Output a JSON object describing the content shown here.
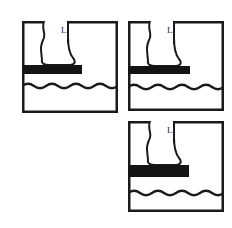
{
  "figure": {
    "type": "line-drawing-sequence",
    "background_color": "#ffffff",
    "ink_color": "#1a1a1a",
    "board_color": "#141414",
    "frame_color": "#1a1a1a",
    "panel_count": 3
  },
  "panels": [
    {
      "id": "panel-1",
      "index": 1,
      "position": "top-left",
      "x": 22,
      "y": 21,
      "width": 96,
      "height": 92,
      "frame_width": 2.5,
      "leg_label": "L",
      "label_x": 39,
      "label_y": 5,
      "board": {
        "name": "diving-board",
        "x": 0,
        "y": 44,
        "width": 60,
        "height": 9,
        "color": "#141414"
      },
      "water": {
        "name": "water-surface",
        "y": 65,
        "amplitude": 4.5,
        "cycles": 4,
        "stroke_width": 2.2
      },
      "foot": {
        "ankle_x": 30,
        "heel_x": 20,
        "toe_x": 52,
        "sole_y": 44,
        "leg_top_y": 0
      }
    },
    {
      "id": "panel-2",
      "index": 2,
      "position": "top-right",
      "x": 128,
      "y": 21,
      "width": 96,
      "height": 90,
      "frame_width": 2.5,
      "leg_label": "L",
      "label_x": 39,
      "label_y": 5,
      "board": {
        "name": "diving-board",
        "x": 0,
        "y": 45,
        "width": 62,
        "height": 8,
        "color": "#141414"
      },
      "water": {
        "name": "water-surface",
        "y": 66,
        "amplitude": 4.5,
        "cycles": 4,
        "stroke_width": 2.2
      },
      "foot": {
        "ankle_x": 30,
        "heel_x": 20,
        "toe_x": 52,
        "sole_y": 45,
        "leg_top_y": 0
      }
    },
    {
      "id": "panel-3",
      "index": 3,
      "position": "bottom-right",
      "x": 128,
      "y": 121,
      "width": 96,
      "height": 91,
      "frame_width": 2.5,
      "leg_label": "L",
      "label_x": 39,
      "label_y": 5,
      "board": {
        "name": "diving-board",
        "x": 0,
        "y": 44,
        "width": 61,
        "height": 12,
        "color": "#141414"
      },
      "water": {
        "name": "water-surface",
        "y": 72,
        "amplitude": 4.5,
        "cycles": 4,
        "stroke_width": 2.2
      },
      "foot": {
        "ankle_x": 30,
        "heel_x": 20,
        "toe_x": 52,
        "sole_y": 44,
        "leg_top_y": 0
      }
    }
  ]
}
